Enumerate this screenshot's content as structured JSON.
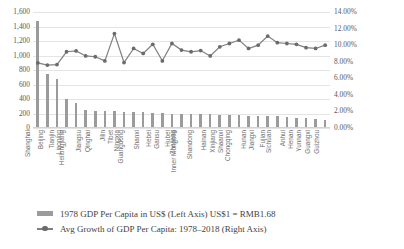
{
  "chart_data": {
    "type": "bar",
    "title": "",
    "subtitle": "",
    "xlabel": "",
    "ylabel": "",
    "grid": true,
    "legend_position": "bottom-left",
    "categories": [
      "Shanghai",
      "Beijing",
      "Tianjin",
      "Liaoning",
      "Heilongjiang",
      "Jiangsu",
      "Qinghai",
      "Jilin",
      "Tibet",
      "Ningxia",
      "Guangdong",
      "Shanxi",
      "Hebei",
      "Gansu",
      "Hubei",
      "Zhejiang",
      "Inner Mongolia",
      "Shandong",
      "Hainan",
      "Xinjiang",
      "Shaanxi",
      "Chongqing",
      "Hunan",
      "Jiangxi",
      "Fujian",
      "Sichuan",
      "Anhui",
      "Henan",
      "Yunnan",
      "Guangxi",
      "Guizhou"
    ],
    "left_axis": {
      "label": "1978 GDP Per Capita in US$",
      "ticks": [
        "0",
        "200",
        "400",
        "600",
        "800",
        "1,000",
        "1,200",
        "1,400",
        "1,600"
      ],
      "min": 0,
      "max": 1600,
      "step": 200
    },
    "right_axis": {
      "label": "Avg Growth of GDP Per Capita: 1978-2018",
      "ticks": [
        "0.00%",
        "2.00%",
        "4.00%",
        "6.00%",
        "8.00%",
        "10.00%",
        "12.00%",
        "14.00%"
      ],
      "min": 0,
      "max": 14,
      "step": 2
    },
    "series": [
      {
        "name": "1978 GDP Per Capita in US$ (Left Axis)  US$1 = RMB1.68",
        "type": "bar",
        "axis": "left",
        "color": "#9b9b9b",
        "values": [
          1475,
          740,
          670,
          400,
          340,
          250,
          240,
          235,
          230,
          225,
          220,
          215,
          210,
          205,
          200,
          198,
          195,
          190,
          188,
          185,
          180,
          176,
          172,
          168,
          164,
          160,
          150,
          142,
          132,
          120,
          108
        ]
      },
      {
        "name": "Avg Growth of GDP Per Capita: 1978-2018 (Right Axis)",
        "type": "line",
        "axis": "right",
        "color": "#808080",
        "values": [
          7.85,
          7.6,
          7.65,
          9.2,
          9.3,
          8.7,
          8.6,
          8.1,
          11.4,
          7.9,
          9.6,
          9.0,
          10.1,
          8.1,
          10.2,
          9.4,
          9.2,
          9.35,
          8.7,
          9.8,
          10.2,
          10.6,
          9.6,
          10.0,
          11.1,
          10.3,
          10.2,
          10.1,
          9.7,
          9.6,
          10.0
        ]
      }
    ]
  },
  "legend": {
    "items": [
      {
        "marker": "bar-swatch",
        "label": "1978 GDP Per Capita in US$ (Left Axis)  US$1 = RMB1.68"
      },
      {
        "marker": "line-marker",
        "label": "Avg Growth of GDP Per Capita: 1978–2018 (Right Axis)"
      }
    ]
  }
}
